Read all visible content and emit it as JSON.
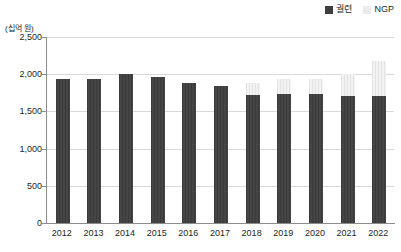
{
  "chart_data": {
    "type": "bar",
    "stacked": true,
    "title": "",
    "subtitle": "",
    "xlabel": "",
    "ylabel": "(십억 원)",
    "unit_caption": "(십억 원)",
    "categories": [
      "2012",
      "2013",
      "2014",
      "2015",
      "2016",
      "2017",
      "2018",
      "2019",
      "2020",
      "2021",
      "2022"
    ],
    "series": [
      {
        "name": "궐련",
        "color": "#3f3f3f",
        "values": [
          1930,
          1930,
          2000,
          1960,
          1880,
          1840,
          1720,
          1740,
          1730,
          1710,
          1710
        ]
      },
      {
        "name": "NGP",
        "color": "#ebebeb",
        "values": [
          0,
          0,
          0,
          0,
          0,
          0,
          160,
          200,
          200,
          290,
          470
        ]
      }
    ],
    "totals": [
      1930,
      1930,
      2000,
      1960,
      1880,
      1840,
      1880,
      1940,
      1930,
      2000,
      2180
    ],
    "ylim": [
      0,
      2500
    ],
    "yticks": [
      0,
      500,
      1000,
      1500,
      2000,
      2500
    ],
    "ytick_labels": [
      "0",
      "500",
      "1,000",
      "1,500",
      "2,000",
      "2,500"
    ],
    "grid": true,
    "legend_position": "top-right"
  },
  "legend": {
    "items": [
      {
        "label": "궐련",
        "swatch": "dark-square-icon"
      },
      {
        "label": "NGP",
        "swatch": "light-square-icon"
      }
    ]
  }
}
